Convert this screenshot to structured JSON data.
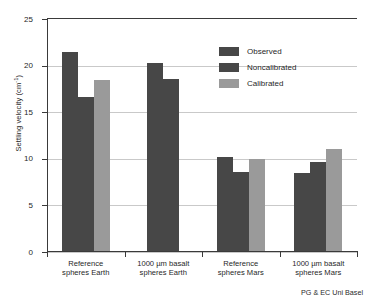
{
  "chart_data": {
    "type": "bar",
    "title": "",
    "xlabel": "",
    "ylabel": "Settling velocity (cm",
    "ylabel_sup": "-1",
    "ylabel_suffix": ")",
    "ylim": [
      0,
      25
    ],
    "yticks": [
      0,
      5,
      10,
      15,
      20,
      25
    ],
    "ytick_labels": [
      "0",
      "5",
      "10",
      "15",
      "20",
      "25"
    ],
    "grid": true,
    "legend_position": "upper right",
    "categories": [
      "Reference\nspheres Earth",
      "1000 µm basalt\nspheres Earth",
      "Reference\nspheres Mars",
      "1000 µm basalt\nspheres Mars"
    ],
    "category_lines": [
      [
        "Reference",
        "spheres Earth"
      ],
      [
        "1000 µm basalt",
        "spheres Earth"
      ],
      [
        "Reference",
        "spheres Mars"
      ],
      [
        "1000 µm basalt",
        "spheres Mars"
      ]
    ],
    "series": [
      {
        "name": "Observed",
        "color": "#474747",
        "values": [
          21.4,
          20.2,
          10.1,
          8.4
        ]
      },
      {
        "name": "Noncalibrated",
        "color": "#474747",
        "values": [
          16.5,
          18.5,
          8.5,
          9.6
        ]
      },
      {
        "name": "Calibrated",
        "color": "#9a9a9a",
        "values": [
          18.3,
          null,
          9.9,
          10.9
        ]
      }
    ],
    "annotations": {
      "footer": "PG & EC Uni Basel"
    }
  },
  "legend": {
    "items": [
      {
        "label": "Observed",
        "color": "#474747"
      },
      {
        "label": "Noncalibrated",
        "color": "#474747"
      },
      {
        "label": "Calibrated",
        "color": "#9a9a9a"
      }
    ]
  },
  "colors": {
    "dark_bar": "#474747",
    "light_bar": "#9a9a9a",
    "axis": "#3a3a3a",
    "grid": "#c9c9c9",
    "background": "#ffffff"
  }
}
